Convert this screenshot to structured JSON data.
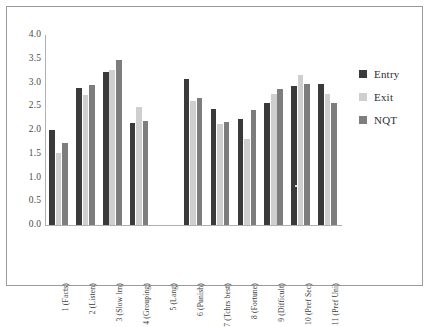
{
  "chart_data": {
    "type": "bar",
    "title": "",
    "subtitle": "",
    "xlabel": "",
    "ylabel": "",
    "ylim": [
      0.0,
      4.0
    ],
    "ytick_labels": [
      "4.0",
      "3.5",
      "3.0",
      "2.5",
      "2.0",
      "1.5",
      "1.0",
      "0.5",
      "0.0"
    ],
    "ytick_values": [
      4.0,
      3.5,
      3.0,
      2.5,
      2.0,
      1.5,
      1.0,
      0.5,
      0.0
    ],
    "grid": false,
    "legend_position": "right",
    "categories": [
      "1 (Facts)",
      "2 (Listen)",
      "3 (Slow lrn)",
      "4 (Grouping)",
      "5 (Lang)",
      "6 (Punish)",
      "7 (Tchrs best)",
      "8 (Fortune)",
      "9 (Difficult)",
      "10 (Pref Sec)",
      "11 (Pref Uni)"
    ],
    "series": [
      {
        "name": "Entry",
        "color": "#3a3a3a",
        "values": [
          2.0,
          2.89,
          3.23,
          2.14,
          null,
          3.08,
          2.44,
          2.23,
          2.57,
          2.92,
          2.97
        ]
      },
      {
        "name": "Exit",
        "color": "#cfcfcf",
        "values": [
          1.52,
          2.74,
          3.27,
          2.49,
          null,
          2.62,
          2.13,
          1.82,
          2.76,
          3.16,
          2.76
        ]
      },
      {
        "name": "NQT",
        "color": "#7d7d7d",
        "values": [
          1.73,
          2.94,
          3.48,
          2.18,
          null,
          2.67,
          2.17,
          2.43,
          2.87,
          2.97,
          2.56
        ]
      }
    ]
  },
  "legend": {
    "items": [
      {
        "label": "Entry",
        "color": "#3a3a3a"
      },
      {
        "label": "Exit",
        "color": "#cfcfcf"
      },
      {
        "label": "NQT",
        "color": "#7d7d7d"
      }
    ]
  }
}
